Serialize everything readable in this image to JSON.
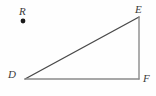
{
  "figure": {
    "kind": "right-triangle-with-external-point",
    "canvas": {
      "width": 156,
      "height": 96,
      "background": "#fefefe"
    },
    "colors": {
      "hypotenuse_stroke": "#4a4a4a",
      "leg_vertical_stroke": "#8a8a8a",
      "leg_horizontal_stroke": "#8a8a8a",
      "point_fill": "#1a1a1a",
      "label_color": "#3a3a3a"
    },
    "points": [
      {
        "id": "R",
        "label": "R",
        "x": 23,
        "y": 21,
        "marked": true,
        "role": "external-point"
      },
      {
        "id": "E",
        "label": "E",
        "x": 139,
        "y": 17,
        "marked": false,
        "role": "triangle-vertex"
      },
      {
        "id": "D",
        "label": "D",
        "x": 25,
        "y": 79,
        "marked": false,
        "role": "triangle-vertex"
      },
      {
        "id": "F",
        "label": "F",
        "x": 139,
        "y": 79,
        "marked": false,
        "role": "triangle-vertex"
      }
    ],
    "segments": [
      {
        "id": "DE",
        "name": "hypotenuse",
        "from": "D",
        "to": "E",
        "x1": 25,
        "y1": 79,
        "x2": 139,
        "y2": 17,
        "stroke": "#4a4a4a",
        "width": 1.4
      },
      {
        "id": "EF",
        "name": "vertical-leg",
        "from": "E",
        "to": "F",
        "x1": 139,
        "y1": 17,
        "x2": 139,
        "y2": 79,
        "stroke": "#8a8a8a",
        "width": 1.4
      },
      {
        "id": "DF",
        "name": "horizontal-leg",
        "from": "D",
        "to": "F",
        "x1": 25,
        "y1": 79,
        "x2": 139,
        "y2": 79,
        "stroke": "#8a8a8a",
        "width": 1.4
      }
    ],
    "point_marker": {
      "cx": 23,
      "cy": 21,
      "r": 2.4,
      "fill": "#1a1a1a"
    },
    "right_angle_at": "F"
  },
  "labels": {
    "R": "R",
    "E": "E",
    "D": "D",
    "F": "F"
  }
}
